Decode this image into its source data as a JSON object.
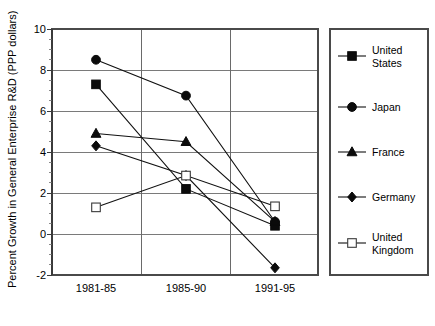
{
  "chart_data": {
    "type": "line",
    "title": "",
    "subtitle": "",
    "xlabel": "",
    "ylabel": "Percent Growth in General Enterprise R&D (PPP dollars)",
    "categories": [
      "1981-85",
      "1985-90",
      "1991-95"
    ],
    "ylim": [
      -2,
      10
    ],
    "yticks": [
      -2,
      0,
      2,
      4,
      6,
      8,
      10
    ],
    "ytick_labels": [
      "-2",
      "0",
      "2",
      "4",
      "6",
      "8",
      "10"
    ],
    "grid": "horizontal-and-vertical",
    "legend_position": "right-outside",
    "series": [
      {
        "name": "United States",
        "marker": "filled-square",
        "values": [
          7.3,
          2.2,
          0.4
        ]
      },
      {
        "name": "Japan",
        "marker": "filled-circle",
        "values": [
          8.5,
          6.75,
          0.6
        ]
      },
      {
        "name": "France",
        "marker": "filled-triangle",
        "values": [
          4.9,
          4.5,
          0.6
        ]
      },
      {
        "name": "Germany",
        "marker": "filled-diamond",
        "values": [
          4.3,
          2.85,
          -1.65
        ]
      },
      {
        "name": "United Kingdom",
        "marker": "open-square",
        "values": [
          1.3,
          2.85,
          1.35
        ]
      }
    ]
  },
  "axis": {
    "y_title": "Percent Growth in General Enterprise R&D (PPP dollars)",
    "y_ticks": [
      "10",
      "8",
      "6",
      "4",
      "2",
      "0",
      "-2"
    ],
    "x_ticks": [
      "1981-85",
      "1985-90",
      "1991-95"
    ]
  },
  "legend": {
    "items": [
      {
        "label_line1": "United",
        "label_line2": "States",
        "marker": "filled-square"
      },
      {
        "label_line1": "Japan",
        "label_line2": "",
        "marker": "filled-circle"
      },
      {
        "label_line1": "France",
        "label_line2": "",
        "marker": "filled-triangle"
      },
      {
        "label_line1": "Germany",
        "label_line2": "",
        "marker": "filled-diamond"
      },
      {
        "label_line1": "United",
        "label_line2": "Kingdom",
        "marker": "open-square"
      }
    ]
  },
  "colors": {
    "marker_fill": "#0b0b0b",
    "line": "#111111",
    "grid": "#7a7a7a",
    "border": "#4a4a4a",
    "background": "#ffffff"
  }
}
